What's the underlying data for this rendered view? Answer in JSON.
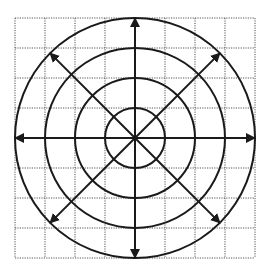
{
  "diagram": {
    "type": "polar-grid-with-vectors",
    "canvas": {
      "width": 268,
      "height": 273
    },
    "center": {
      "x": 135,
      "y": 138
    },
    "grid": {
      "x0": 15,
      "y0": 18,
      "cell": 30,
      "cols": 8,
      "rows": 8,
      "color": "#555555",
      "dash": "1.2,1.2"
    },
    "circles": [
      {
        "r": 30
      },
      {
        "r": 60
      },
      {
        "r": 90
      },
      {
        "r": 120
      }
    ],
    "arrows": [
      {
        "name": "up",
        "angle_deg": 90,
        "length": 120
      },
      {
        "name": "down",
        "angle_deg": 270,
        "length": 120
      },
      {
        "name": "left",
        "angle_deg": 180,
        "length": 120
      },
      {
        "name": "right",
        "angle_deg": 0,
        "length": 120
      },
      {
        "name": "up-left",
        "angle_deg": 135,
        "length": 120
      },
      {
        "name": "up-right",
        "angle_deg": 45,
        "length": 120
      },
      {
        "name": "down-left",
        "angle_deg": 225,
        "length": 120
      },
      {
        "name": "down-right",
        "angle_deg": 315,
        "length": 120
      }
    ],
    "stroke_color": "#1a1a1a"
  }
}
